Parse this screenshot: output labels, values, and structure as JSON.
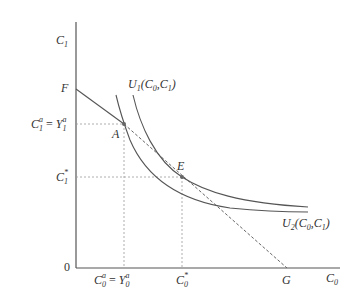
{
  "diagram": {
    "axes": {
      "y_label": "C",
      "y_label_sub": "1",
      "x_label": "C",
      "x_label_sub": "0",
      "origin_label": "0"
    },
    "points": {
      "F": "F",
      "A": "A",
      "E": "E",
      "G": "G"
    },
    "curves": {
      "U1": {
        "name": "U",
        "sub": "1",
        "args_open": "(C",
        "args_sub0": "0",
        "args_mid": ",C",
        "args_sub1": "1",
        "args_close": ")"
      },
      "U2": {
        "name": "U",
        "sub": "2",
        "args_open": "(C",
        "args_sub0": "0",
        "args_mid": ",C",
        "args_sub1": "1",
        "args_close": ")"
      }
    },
    "y_ticks": {
      "a_left": "C",
      "a_left_sub": "1",
      "a_left_sup": "a",
      "a_eq": " = ",
      "a_right": "Y",
      "a_right_sub": "1",
      "a_right_sup": "a",
      "star": "C",
      "star_sub": "1",
      "star_sup": "*"
    },
    "x_ticks": {
      "a_left": "C",
      "a_left_sub": "0",
      "a_left_sup": "a",
      "a_eq": " = ",
      "a_right": "Y",
      "a_right_sub": "0",
      "a_right_sup": "a",
      "star": "C",
      "star_sub": "0",
      "star_sup": "*"
    },
    "colors": {
      "axis": "#555555",
      "curve": "#555555",
      "dashed": "#888888",
      "text": "#333333"
    }
  }
}
